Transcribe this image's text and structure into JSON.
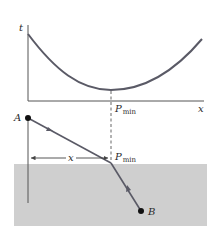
{
  "diagram": {
    "type": "refraction-least-time",
    "colors": {
      "curve": "#5a5a66",
      "axis": "#555555",
      "path": "#5a5a66",
      "medium": "#cfcfcf",
      "point": "#111111",
      "text": "#2a2a2a"
    },
    "graph": {
      "y_axis_label": "t",
      "x_axis_label": "x",
      "min_label_main": "P",
      "min_label_sub": "min"
    },
    "geometry": {
      "point_a_label": "A",
      "point_b_label": "B",
      "distance_label": "x",
      "refraction_point_main": "P",
      "refraction_point_sub": "min"
    }
  }
}
